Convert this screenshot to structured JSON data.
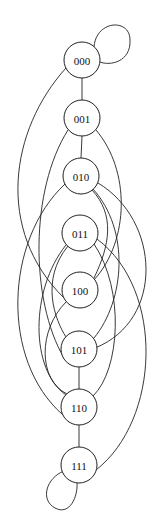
{
  "diagram": {
    "type": "graph",
    "nodes": [
      {
        "id": "000",
        "label": "000",
        "x": 82,
        "y": 60
      },
      {
        "id": "001",
        "label": "001",
        "x": 82,
        "y": 118
      },
      {
        "id": "010",
        "label": "010",
        "x": 81,
        "y": 176
      },
      {
        "id": "011",
        "label": "011",
        "x": 80,
        "y": 233
      },
      {
        "id": "100",
        "label": "100",
        "x": 80,
        "y": 290
      },
      {
        "id": "101",
        "label": "101",
        "x": 79,
        "y": 349
      },
      {
        "id": "110",
        "label": "110",
        "x": 79,
        "y": 407
      },
      {
        "id": "111",
        "label": "111",
        "x": 79,
        "y": 465
      }
    ],
    "edges": [
      [
        "000",
        "000"
      ],
      [
        "000",
        "001"
      ],
      [
        "000",
        "100"
      ],
      [
        "001",
        "010"
      ],
      [
        "001",
        "100"
      ],
      [
        "001",
        "101"
      ],
      [
        "010",
        "011"
      ],
      [
        "010",
        "100"
      ],
      [
        "010",
        "101"
      ],
      [
        "010",
        "110"
      ],
      [
        "011",
        "100"
      ],
      [
        "011",
        "101"
      ],
      [
        "011",
        "110"
      ],
      [
        "011",
        "111"
      ],
      [
        "100",
        "101"
      ],
      [
        "100",
        "110"
      ],
      [
        "101",
        "110"
      ],
      [
        "101",
        "111"
      ],
      [
        "110",
        "111"
      ],
      [
        "111",
        "111"
      ]
    ]
  }
}
